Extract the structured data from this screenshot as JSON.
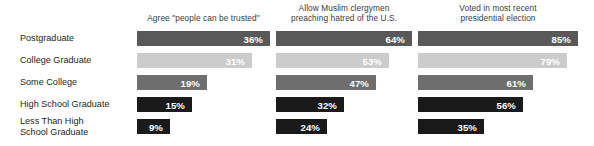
{
  "chart_data": {
    "type": "bar",
    "orientation": "horizontal",
    "title": "",
    "xlabel": "",
    "ylabel": "",
    "grid": false,
    "legend": "none",
    "value_suffix": "%",
    "categories": [
      "Postgraduate",
      "College Graduate",
      "Some College",
      "High School Graduate",
      "Less Than High\nSchool Graduate"
    ],
    "series": [
      {
        "name": "Agree \"people can be trusted\"",
        "values": [
          36,
          31,
          19,
          15,
          9
        ]
      },
      {
        "name": "Allow Muslim clergymen preaching hatred of the U.S.",
        "values": [
          64,
          53,
          47,
          32,
          24
        ]
      },
      {
        "name": "Voted in most recent presidential election",
        "values": [
          85,
          79,
          61,
          56,
          35
        ]
      }
    ],
    "row_colors": [
      "#595959",
      "#cccccc",
      "#6e6e6e",
      "#1a1a1a",
      "#1a1a1a"
    ]
  },
  "headers": {
    "col1_line1": "Agree \"people can be trusted\"",
    "col2_line1": "Allow Muslim clergymen",
    "col2_line2": "preaching hatred of the U.S.",
    "col3_line1": "Voted in most recent",
    "col3_line2": "presidential election"
  },
  "rows": [
    {
      "label_line1": "Postgraduate",
      "label_line2": "",
      "color": "#595959",
      "c1": "36%",
      "c2": "64%",
      "c3": "85%"
    },
    {
      "label_line1": "College Graduate",
      "label_line2": "",
      "color": "#cccccc",
      "c1": "31%",
      "c2": "53%",
      "c3": "79%"
    },
    {
      "label_line1": "Some College",
      "label_line2": "",
      "color": "#6e6e6e",
      "c1": "19%",
      "c2": "47%",
      "c3": "61%"
    },
    {
      "label_line1": "High School Graduate",
      "label_line2": "",
      "color": "#1a1a1a",
      "c1": "15%",
      "c2": "32%",
      "c3": "56%"
    },
    {
      "label_line1": "Less Than High",
      "label_line2": "School Graduate",
      "color": "#1a1a1a",
      "c1": "9%",
      "c2": "24%",
      "c3": "35%"
    }
  ]
}
